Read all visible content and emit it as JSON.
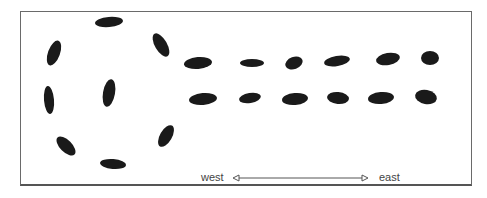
{
  "diagram": {
    "labels": {
      "west": "west",
      "east": "east"
    },
    "colors": {
      "stone": "#1a1a1a",
      "frame": "#6a6a6a",
      "arrow": "#555555",
      "text": "#444444"
    },
    "circle_stones": [
      {
        "x": 109,
        "y": 22,
        "rx": 14,
        "ry": 5,
        "rot": -5
      },
      {
        "x": 54,
        "y": 53,
        "rx": 13,
        "ry": 6,
        "rot": -70
      },
      {
        "x": 161,
        "y": 45,
        "rx": 13,
        "ry": 6,
        "rot": 60
      },
      {
        "x": 49,
        "y": 100,
        "rx": 14,
        "ry": 5,
        "rot": 85
      },
      {
        "x": 109,
        "y": 93,
        "rx": 14,
        "ry": 6,
        "rot": -80
      },
      {
        "x": 66,
        "y": 146,
        "rx": 12,
        "ry": 6,
        "rot": 45
      },
      {
        "x": 166,
        "y": 136,
        "rx": 12,
        "ry": 6,
        "rot": -60
      },
      {
        "x": 113,
        "y": 164,
        "rx": 13,
        "ry": 5,
        "rot": 5
      }
    ],
    "rows": [
      {
        "name": "north-row",
        "stones": [
          {
            "x": 198,
            "y": 63,
            "rx": 14,
            "ry": 6,
            "rot": -5
          },
          {
            "x": 252,
            "y": 63,
            "rx": 12,
            "ry": 4,
            "rot": 0
          },
          {
            "x": 294,
            "y": 63,
            "rx": 9,
            "ry": 6,
            "rot": -20
          },
          {
            "x": 337,
            "y": 61,
            "rx": 13,
            "ry": 5,
            "rot": -10
          },
          {
            "x": 388,
            "y": 59,
            "rx": 12,
            "ry": 6,
            "rot": -10
          },
          {
            "x": 430,
            "y": 58,
            "rx": 9,
            "ry": 7,
            "rot": 0
          }
        ]
      },
      {
        "name": "south-row",
        "stones": [
          {
            "x": 203,
            "y": 99,
            "rx": 14,
            "ry": 6,
            "rot": -5
          },
          {
            "x": 250,
            "y": 98,
            "rx": 11,
            "ry": 5,
            "rot": -10
          },
          {
            "x": 295,
            "y": 99,
            "rx": 13,
            "ry": 6,
            "rot": -5
          },
          {
            "x": 338,
            "y": 98,
            "rx": 11,
            "ry": 6,
            "rot": 5
          },
          {
            "x": 381,
            "y": 98,
            "rx": 13,
            "ry": 6,
            "rot": -5
          },
          {
            "x": 426,
            "y": 97,
            "rx": 11,
            "ry": 7,
            "rot": 10
          }
        ]
      }
    ],
    "arrow": {
      "x1": 233,
      "x2": 368,
      "y": 178
    }
  }
}
